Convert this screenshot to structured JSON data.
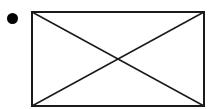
{
  "list_item": {
    "bullet": "bullet-dot",
    "image_placeholder": {
      "icon": "image-placeholder-icon",
      "stroke_color": "#1a1a1a"
    }
  }
}
